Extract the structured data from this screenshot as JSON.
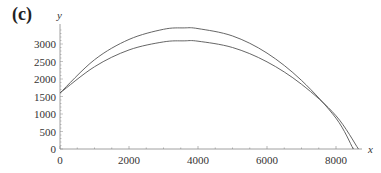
{
  "panel_label": "(c)",
  "chart_data": {
    "type": "line",
    "title": "",
    "xlabel": "x",
    "ylabel": "y",
    "xlim": [
      0,
      8800
    ],
    "ylim": [
      0,
      3500
    ],
    "x_ticks": [
      0,
      2000,
      4000,
      6000,
      8000
    ],
    "y_ticks": [
      0,
      500,
      1000,
      1500,
      2000,
      2500,
      3000
    ],
    "grid": false,
    "legend": null,
    "series": [
      {
        "name": "upper trajectory",
        "x": [
          0,
          1000,
          2000,
          3000,
          3600,
          4000,
          5000,
          6000,
          7000,
          8000,
          8500
        ],
        "y": [
          1600,
          2550,
          3130,
          3420,
          3460,
          3440,
          3230,
          2740,
          1960,
          880,
          0
        ]
      },
      {
        "name": "lower trajectory",
        "x": [
          0,
          1000,
          2000,
          3000,
          3600,
          4000,
          5000,
          6000,
          7000,
          8000,
          8650
        ],
        "y": [
          1600,
          2350,
          2830,
          3060,
          3090,
          3080,
          2900,
          2490,
          1850,
          950,
          0
        ]
      }
    ],
    "colors": {
      "lines": "#555555",
      "axes": "#888888",
      "text": "#333333"
    }
  }
}
